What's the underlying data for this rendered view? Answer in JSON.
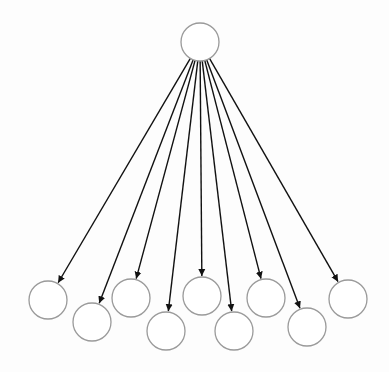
{
  "diagram": {
    "type": "tree-fan-out",
    "root": {
      "id": "root",
      "cx": 200,
      "cy": 42,
      "r": 19
    },
    "children": [
      {
        "id": "child-1",
        "cx": 48,
        "cy": 300,
        "r": 19
      },
      {
        "id": "child-2",
        "cx": 92,
        "cy": 322,
        "r": 19
      },
      {
        "id": "child-3",
        "cx": 131,
        "cy": 298,
        "r": 19
      },
      {
        "id": "child-4",
        "cx": 166,
        "cy": 331,
        "r": 19
      },
      {
        "id": "child-5",
        "cx": 202,
        "cy": 296,
        "r": 19
      },
      {
        "id": "child-6",
        "cx": 234,
        "cy": 331,
        "r": 19
      },
      {
        "id": "child-7",
        "cx": 266,
        "cy": 298,
        "r": 19
      },
      {
        "id": "child-8",
        "cx": 307,
        "cy": 327,
        "r": 19
      },
      {
        "id": "child-9",
        "cx": 348,
        "cy": 299,
        "r": 19
      }
    ],
    "colors": {
      "node_stroke": "#9a9a9a",
      "edge": "#111111",
      "background": "#fdfdfd"
    }
  }
}
